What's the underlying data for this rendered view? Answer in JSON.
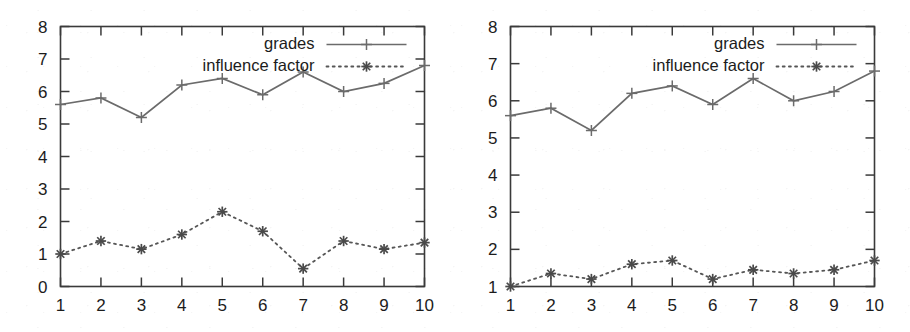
{
  "figure": {
    "panel_count": 2,
    "background_color": "#ffffff",
    "series_colors": {
      "grades": "#6b6b6b",
      "influence_factor": "#4a4a4a"
    }
  },
  "chart_data": [
    {
      "panel": "left",
      "type": "line",
      "title": "",
      "xlabel": "",
      "ylabel": "",
      "x": [
        1,
        2,
        3,
        4,
        5,
        6,
        7,
        8,
        9,
        10
      ],
      "xtick_labels": [
        "1",
        "2",
        "3",
        "4",
        "5",
        "6",
        "7",
        "8",
        "9",
        "10"
      ],
      "ytick_labels": [
        "0",
        "1",
        "2",
        "3",
        "4",
        "5",
        "6",
        "7",
        "8"
      ],
      "xlim": [
        1,
        10
      ],
      "ylim": [
        0,
        8
      ],
      "grid": false,
      "legend_position": "top-right inside",
      "series": [
        {
          "name": "grades",
          "marker": "plus",
          "linestyle": "solid",
          "values": [
            5.6,
            5.8,
            5.2,
            6.2,
            6.4,
            5.9,
            6.6,
            6.0,
            6.25,
            6.8
          ]
        },
        {
          "name": "influence factor",
          "marker": "star",
          "linestyle": "dotted",
          "values": [
            1.0,
            1.4,
            1.15,
            1.6,
            2.3,
            1.7,
            0.55,
            1.4,
            1.15,
            1.35
          ]
        }
      ]
    },
    {
      "panel": "right",
      "type": "line",
      "title": "",
      "xlabel": "",
      "ylabel": "",
      "x": [
        1,
        2,
        3,
        4,
        5,
        6,
        7,
        8,
        9,
        10
      ],
      "xtick_labels": [
        "1",
        "2",
        "3",
        "4",
        "5",
        "6",
        "7",
        "8",
        "9",
        "10"
      ],
      "ytick_labels": [
        "1",
        "2",
        "3",
        "4",
        "5",
        "6",
        "7",
        "8"
      ],
      "xlim": [
        1,
        10
      ],
      "ylim": [
        1,
        8
      ],
      "grid": false,
      "legend_position": "top-right inside",
      "series": [
        {
          "name": "grades",
          "marker": "plus",
          "linestyle": "solid",
          "values": [
            5.6,
            5.8,
            5.2,
            6.2,
            6.4,
            5.9,
            6.6,
            6.0,
            6.25,
            6.8
          ]
        },
        {
          "name": "influence factor",
          "marker": "star",
          "linestyle": "dotted",
          "values": [
            1.0,
            1.35,
            1.2,
            1.6,
            1.7,
            1.2,
            1.45,
            1.35,
            1.45,
            1.7
          ]
        }
      ]
    }
  ]
}
